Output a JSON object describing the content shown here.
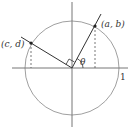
{
  "diagram": {
    "labels": {
      "point_ab": "(a, b)",
      "point_cd": "(c, d)",
      "angle": "θ",
      "unit_tick": "1"
    },
    "colors": {
      "circle": "#a0a0a0",
      "axes": "#777777",
      "lines": "#333333",
      "dashed": "#555555"
    }
  }
}
